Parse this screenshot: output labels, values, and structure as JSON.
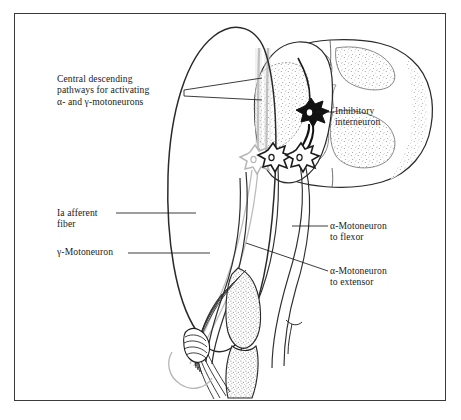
{
  "figure": {
    "domain": "anatomical-diagram",
    "title_text": "",
    "background_color": "#ffffff",
    "frame_color": "#3a3a3a",
    "ink_color": "#1a1a1a",
    "gamma_fiber_color": "#b9b9b9",
    "stipple_color": "#8c8c8c"
  },
  "labels": {
    "central_descending": "Central descending\npathways for activating\nα- and γ-motoneurons",
    "inhibitory_interneuron": "Inhibitory\ninterneuron",
    "ia_afferent": "Ia afferent\nfiber",
    "gamma_motoneuron": "γ-Motoneuron",
    "alpha_flexor": "α-Motoneuron\nto flexor",
    "alpha_extensor": "α-Motoneuron\nto extensor"
  },
  "structures": {
    "spinal_cord": "spinal-cord-cross-section",
    "gray_matter": "butterfly-gray-matter",
    "neurons": [
      {
        "name": "inhibitory-interneuron",
        "fill": "#111111"
      },
      {
        "name": "gamma-motoneuron",
        "fill": "#b9b9b9"
      },
      {
        "name": "alpha-motoneuron-flexor",
        "fill": "#1a1a1a"
      },
      {
        "name": "alpha-motoneuron-extensor",
        "fill": "#1a1a1a"
      }
    ],
    "muscle_spindle": "muscle-spindle",
    "extensor_muscle": "extensor-muscle",
    "flexor_muscle": "flexor-muscle",
    "descending_tracts": 2
  }
}
